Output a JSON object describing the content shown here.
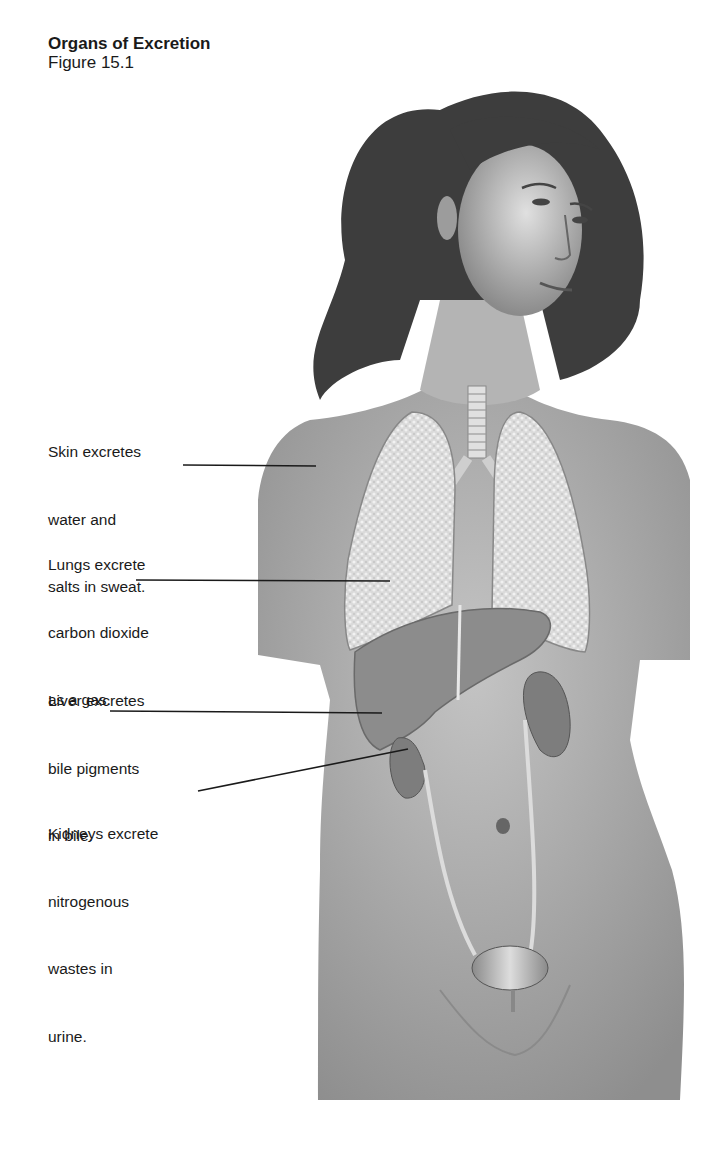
{
  "figure": {
    "title": "Organs of Excretion",
    "number": "Figure 15.1"
  },
  "labels": [
    {
      "id": "skin",
      "lines": [
        "Skin excretes",
        "water and",
        "salts in sweat."
      ],
      "organ": "skin"
    },
    {
      "id": "lungs",
      "lines": [
        "Lungs excrete",
        "carbon dioxide",
        "as a gas."
      ],
      "organ": "lungs"
    },
    {
      "id": "liver",
      "lines": [
        "Liver excretes",
        "bile pigments",
        "in bile."
      ],
      "organ": "liver"
    },
    {
      "id": "kidneys",
      "lines": [
        "Kidneys excrete",
        "nitrogenous",
        "wastes in",
        "urine."
      ],
      "organ": "kidneys"
    }
  ],
  "colors": {
    "background": "#ffffff",
    "text": "#1a1a1a",
    "skin": "#a8a8a8",
    "hair": "#3a3a3a",
    "lungs": "#d6d6d6",
    "liver": "#8a8a8a",
    "kidneys": "#7a7a7a",
    "leader_line": "#1a1a1a"
  }
}
